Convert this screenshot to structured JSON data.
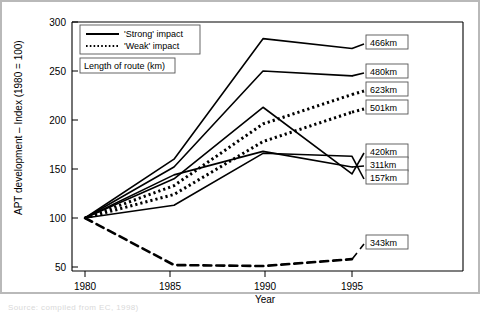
{
  "chart_data": {
    "type": "line",
    "title": "",
    "xlabel": "Year",
    "ylabel": "APT development – Index (1980 = 100)",
    "x": [
      1980,
      1985,
      1990,
      1995
    ],
    "xticklabels": [
      "1980",
      "1985",
      "1990",
      "1995"
    ],
    "yticklabels": [
      "50",
      "100",
      "150",
      "200",
      "250",
      "300"
    ],
    "yticks": [
      50,
      100,
      150,
      200,
      250,
      300
    ],
    "xlim": [
      1978.6,
      1996.6
    ],
    "ylim": [
      50,
      300
    ],
    "grid": false,
    "legend_position": "top-left",
    "legend": [
      {
        "label": "'Strong' impact",
        "style": "solid"
      },
      {
        "label": "'Weak' impact",
        "style": "dotted"
      }
    ],
    "legend_box2": "Length of route (km)",
    "series": [
      {
        "name": "466km",
        "style": "solid",
        "values": [
          100,
          160,
          283,
          273
        ]
      },
      {
        "name": "480km",
        "style": "solid",
        "values": [
          100,
          152,
          250,
          245
        ]
      },
      {
        "name": "623km",
        "style": "dotted",
        "values": [
          100,
          133,
          196,
          226
        ]
      },
      {
        "name": "501km",
        "style": "dotted",
        "values": [
          100,
          124,
          178,
          208
        ]
      },
      {
        "name": "420km",
        "style": "solid",
        "values": [
          100,
          140,
          213,
          145
        ]
      },
      {
        "name": "311km",
        "style": "solid",
        "values": [
          100,
          144,
          168,
          152
        ]
      },
      {
        "name": "157km",
        "style": "solid",
        "values": [
          100,
          113,
          166,
          163
        ]
      },
      {
        "name": "343km",
        "style": "dashed",
        "values": [
          100,
          52,
          51,
          58
        ]
      }
    ]
  },
  "caption": "Source: compiled from EC, 1998)"
}
